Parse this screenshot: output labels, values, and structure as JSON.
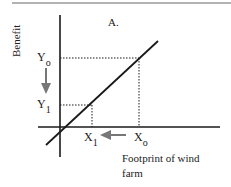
{
  "diagram": {
    "panel_label": "A.",
    "y_axis_label": "Benefit",
    "x_axis_label_line1": "Footprint of wind",
    "x_axis_label_line2": "farm",
    "y_ticks": [
      {
        "base": "Y",
        "sub": "o"
      },
      {
        "base": "Y",
        "sub": "1"
      }
    ],
    "x_ticks": [
      {
        "base": "X",
        "sub": "1"
      },
      {
        "base": "X",
        "sub": "o"
      }
    ],
    "arrows": [
      {
        "name": "y-decrease-arrow",
        "direction": "down",
        "from": "Y0",
        "to": "Y1"
      },
      {
        "name": "x-decrease-arrow",
        "direction": "left",
        "from": "X0",
        "to": "X1"
      }
    ],
    "colors": {
      "axis": "#1a1a1a",
      "arrow": "#777777",
      "top_rule": "#9a9a9a"
    }
  }
}
